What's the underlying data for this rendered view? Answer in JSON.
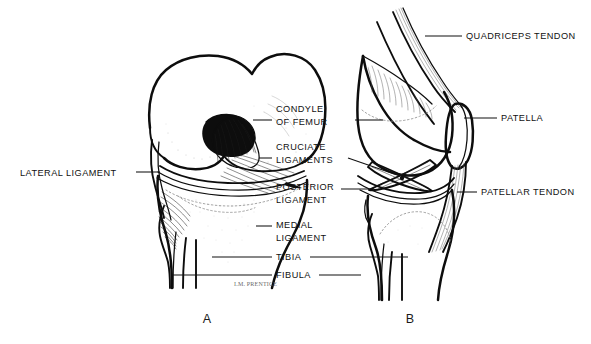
{
  "figure": {
    "signature": "I.M. PRENTICE",
    "background_color": "#ffffff",
    "ink_color": "#0d0d0d"
  },
  "panels": [
    {
      "id": "A",
      "letter": "A",
      "view": "anterior"
    },
    {
      "id": "B",
      "letter": "B",
      "view": "lateral"
    }
  ],
  "labels": {
    "lateral_ligament": "LATERAL LIGAMENT",
    "condyle_line1": "CONDYLE",
    "condyle_line2": "OF FEMUR",
    "cruciate_line1": "CRUCIATE",
    "cruciate_line2": "LIGAMENTS",
    "posterior_line1": "POSTERIOR",
    "posterior_line2": "LIGAMENT",
    "medial_line1": "MEDIAL",
    "medial_line2": "LIGAMENT",
    "tibia": "TIBIA",
    "fibula": "FIBULA",
    "quadriceps_tendon": "QUADRICEPS TENDON",
    "patella": "PATELLA",
    "patellar_tendon": "PATELLAR TENDON"
  }
}
